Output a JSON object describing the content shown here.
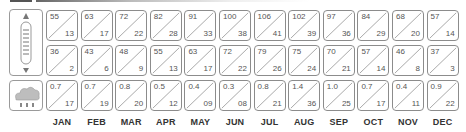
{
  "chart_data": {
    "type": "table",
    "title": "",
    "categories": [
      "JAN",
      "FEB",
      "MAR",
      "APR",
      "MAY",
      "JUN",
      "JUL",
      "AUG",
      "SEP",
      "OCT",
      "NOV",
      "DEC"
    ],
    "series": [
      {
        "name": "Temperature high",
        "row": 1,
        "position": "top-left",
        "icon": "thermometer-icon",
        "values": [
          "55",
          "63",
          "72",
          "82",
          "91",
          "100",
          "106",
          "102",
          "97",
          "84",
          "68",
          "57"
        ]
      },
      {
        "name": "Temperature high (secondary)",
        "row": 1,
        "position": "bottom-right",
        "values": [
          "13",
          "17",
          "22",
          "28",
          "33",
          "38",
          "41",
          "39",
          "36",
          "29",
          "20",
          "14"
        ]
      },
      {
        "name": "Temperature low",
        "row": 2,
        "position": "top-left",
        "values": [
          "36",
          "43",
          "48",
          "55",
          "63",
          "72",
          "79",
          "75",
          "70",
          "57",
          "46",
          "37"
        ]
      },
      {
        "name": "Temperature low (secondary)",
        "row": 2,
        "position": "bottom-right",
        "values": [
          "2",
          "6",
          "9",
          "13",
          "17",
          "22",
          "26",
          "24",
          "21",
          "14",
          "8",
          "3"
        ]
      },
      {
        "name": "Precipitation",
        "row": 3,
        "position": "top-left",
        "icon": "rain-cloud-icon",
        "values": [
          "0.7",
          "0.7",
          "0.8",
          "0.5",
          "0.4",
          "0.3",
          "0.8",
          "1.4",
          "1.0",
          "0.7",
          "0.4",
          "0.9"
        ]
      },
      {
        "name": "Precipitation (secondary)",
        "row": 3,
        "position": "bottom-right",
        "values": [
          "17",
          "19",
          "20",
          "12",
          "09",
          "08",
          "21",
          "36",
          "25",
          "17",
          "11",
          "22"
        ]
      }
    ],
    "layout": {
      "grid": true,
      "legend": "icons on left",
      "cell_style": "diagonal split"
    }
  },
  "months": [
    "JAN",
    "FEB",
    "MAR",
    "APR",
    "MAY",
    "JUN",
    "JUL",
    "AUG",
    "SEP",
    "OCT",
    "NOV",
    "DEC"
  ],
  "rows": [
    {
      "top": [
        "55",
        "63",
        "72",
        "82",
        "91",
        "100",
        "106",
        "102",
        "97",
        "84",
        "68",
        "57"
      ],
      "bottom": [
        "13",
        "17",
        "22",
        "28",
        "33",
        "38",
        "41",
        "39",
        "36",
        "29",
        "20",
        "14"
      ]
    },
    {
      "top": [
        "36",
        "43",
        "48",
        "55",
        "63",
        "72",
        "79",
        "75",
        "70",
        "57",
        "46",
        "37"
      ],
      "bottom": [
        "2",
        "6",
        "9",
        "13",
        "17",
        "22",
        "26",
        "24",
        "21",
        "14",
        "8",
        "3"
      ]
    },
    {
      "top": [
        "0.7",
        "0.7",
        "0.8",
        "0.5",
        "0.4",
        "0.3",
        "0.8",
        "1.4",
        "1.0",
        "0.7",
        "0.4",
        "0.9"
      ],
      "bottom": [
        "17",
        "19",
        "20",
        "12",
        "09",
        "08",
        "21",
        "36",
        "25",
        "17",
        "11",
        "22"
      ]
    }
  ],
  "icons": {
    "temperature": "thermometer-icon",
    "precipitation": "rain-cloud-icon"
  },
  "colors": {
    "border": "#8c8c8c",
    "text": "#555555",
    "label": "#333333",
    "cloud": "#bdbdbd"
  }
}
